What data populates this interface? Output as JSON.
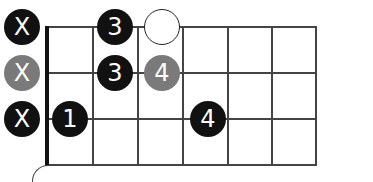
{
  "diagram": {
    "type": "fretboard-chord-diagram",
    "colors": {
      "black_dot": "#111111",
      "gray_dot": "#7a7a7a",
      "open_dot_fill": "#ffffff",
      "grid_line": "#444444",
      "nut": "#111111"
    },
    "grid": {
      "vertical_lines_x": [
        47,
        93,
        138,
        183,
        228,
        272,
        316
      ],
      "horizontal_lines_y": [
        27,
        73,
        119,
        165
      ]
    },
    "markers": [
      {
        "row": 1,
        "label": "X",
        "style": "black",
        "x": 22,
        "y": 27
      },
      {
        "row": 1,
        "label": "3",
        "style": "black",
        "x": 115,
        "y": 27
      },
      {
        "row": 1,
        "label": "",
        "style": "open",
        "x": 162,
        "y": 27
      },
      {
        "row": 2,
        "label": "X",
        "style": "gray",
        "x": 22,
        "y": 73
      },
      {
        "row": 2,
        "label": "3",
        "style": "black",
        "x": 115,
        "y": 73
      },
      {
        "row": 2,
        "label": "4",
        "style": "gray",
        "x": 162,
        "y": 73
      },
      {
        "row": 3,
        "label": "X",
        "style": "black",
        "x": 22,
        "y": 119
      },
      {
        "row": 3,
        "label": "1",
        "style": "black",
        "x": 70,
        "y": 119
      },
      {
        "row": 3,
        "label": "4",
        "style": "black",
        "x": 208,
        "y": 119
      }
    ]
  }
}
